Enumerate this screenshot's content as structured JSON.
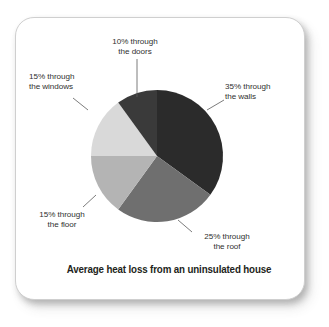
{
  "card": {
    "background_color": "#ffffff",
    "border_color": "#cfcfcf"
  },
  "caption": {
    "text": "Average heat loss from an uninsulated house"
  },
  "chart_data": {
    "type": "pie",
    "title": "Average heat loss from an uninsulated house",
    "xlabel": "",
    "ylabel": "",
    "units": "percent",
    "total": 100,
    "start_angle_deg": 0,
    "direction": "clockwise",
    "legend_position": "none (direct labels with leader lines)",
    "grid": false,
    "categories": [
      "the walls",
      "the roof",
      "the floor",
      "the windows",
      "the doors"
    ],
    "values": [
      35,
      25,
      15,
      15,
      10
    ],
    "colors": [
      "#2b2b2b",
      "#6f6f6f",
      "#b4b4b4",
      "#d9d9d9",
      "#3a3a3a"
    ],
    "slices": [
      {
        "name": "walls",
        "label_line1": "35% through",
        "label_line2": "the walls",
        "value": 35,
        "color": "#2b2b2b",
        "start_deg": 0,
        "end_deg": 126
      },
      {
        "name": "roof",
        "label_line1": "25% through",
        "label_line2": "the roof",
        "value": 25,
        "color": "#6f6f6f",
        "start_deg": 126,
        "end_deg": 216
      },
      {
        "name": "floor",
        "label_line1": "15% through",
        "label_line2": "the floor",
        "value": 15,
        "color": "#b4b4b4",
        "start_deg": 216,
        "end_deg": 270
      },
      {
        "name": "windows",
        "label_line1": "15% through",
        "label_line2": "the windows",
        "value": 15,
        "color": "#d9d9d9",
        "start_deg": 270,
        "end_deg": 324
      },
      {
        "name": "doors",
        "label_line1": "10% through",
        "label_line2": "the doors",
        "value": 10,
        "color": "#3a3a3a",
        "start_deg": 324,
        "end_deg": 360
      }
    ]
  }
}
